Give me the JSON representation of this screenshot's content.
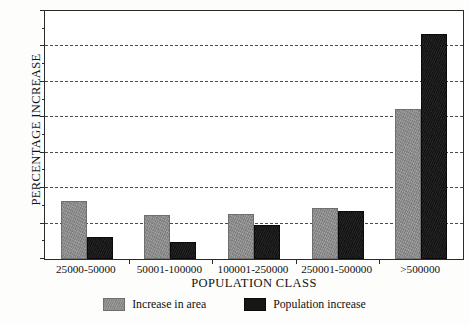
{
  "chart_data": {
    "type": "bar",
    "title": "",
    "xlabel": "POPULATION CLASS",
    "ylabel": "PERCENTAGE INCREASE",
    "categories": [
      "25000-50000",
      "50001-100000",
      "100001-250000",
      "250001-500000",
      ">500000"
    ],
    "series": [
      {
        "name": "Increase in area",
        "color": "#8e8e8e",
        "values": [
          16.5,
          12.3,
          12.8,
          14.3,
          42.3
        ]
      },
      {
        "name": "Population increase",
        "color": "#171717",
        "values": [
          6.2,
          4.8,
          9.5,
          13.6,
          63.5
        ]
      }
    ],
    "ylim": [
      0,
      70
    ],
    "yticks": [
      0,
      10,
      20,
      30,
      40,
      50,
      60,
      70
    ],
    "ytick_labels": [
      "0",
      "10",
      "20",
      "30",
      "40",
      "50",
      "60",
      "70"
    ],
    "yminor_step": 5,
    "grid": true,
    "grid_style": "dashed",
    "grid_axis": "y",
    "legend_position": "bottom-center"
  },
  "legend": {
    "items": [
      {
        "label": "Increase in area"
      },
      {
        "label": "Population increase"
      }
    ]
  }
}
